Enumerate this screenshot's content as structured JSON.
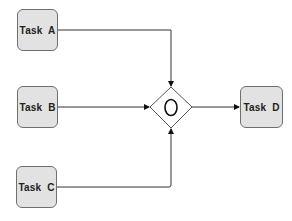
{
  "diagram": {
    "type": "bpmn-merge",
    "nodes": [
      {
        "id": "A",
        "label": "Task  A",
        "kind": "task"
      },
      {
        "id": "B",
        "label": "Task  B",
        "kind": "task"
      },
      {
        "id": "C",
        "label": "Task  C",
        "kind": "task"
      },
      {
        "id": "G",
        "label": "O",
        "kind": "inclusive-gateway"
      },
      {
        "id": "D",
        "label": "Task  D",
        "kind": "task"
      }
    ],
    "edges": [
      {
        "from": "A",
        "to": "G"
      },
      {
        "from": "B",
        "to": "G"
      },
      {
        "from": "C",
        "to": "G"
      },
      {
        "from": "G",
        "to": "D"
      }
    ],
    "colors": {
      "task_fill": "#e2e2e2",
      "stroke": "#333333"
    }
  }
}
